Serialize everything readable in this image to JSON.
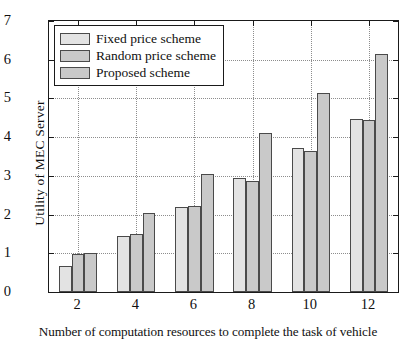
{
  "chart_data": {
    "type": "bar",
    "title": "",
    "xlabel": "Number of computation resources to complete the task of vehicle",
    "ylabel": "Utility of MEC Server",
    "categories": [
      "2",
      "4",
      "6",
      "8",
      "10",
      "12"
    ],
    "xtick_labels": [
      "2",
      "4",
      "6",
      "8",
      "10",
      "12"
    ],
    "ytick_labels": [
      "0",
      "1",
      "2",
      "3",
      "4",
      "5",
      "6",
      "7"
    ],
    "ylim": [
      0,
      7
    ],
    "grid": true,
    "legend_position": "upper-left",
    "series": [
      {
        "name": "Fixed price scheme",
        "color": "#e3e3e3",
        "edge_color": "#4a4a4a",
        "values": [
          0.68,
          1.45,
          2.2,
          2.95,
          3.71,
          4.47
        ]
      },
      {
        "name": "Random price scheme",
        "color": "#c9c9c9",
        "edge_color": "#4a4a4a",
        "values": [
          0.97,
          1.5,
          2.22,
          2.88,
          3.64,
          4.45
        ]
      },
      {
        "name": "Proposed scheme",
        "color": "#c9c9c9",
        "edge_color": "#4a4a4a",
        "values": [
          1.01,
          2.05,
          3.06,
          4.1,
          5.13,
          6.16
        ]
      }
    ]
  }
}
